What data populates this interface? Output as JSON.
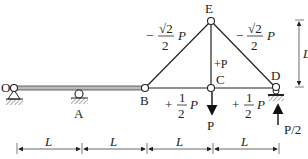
{
  "diagram": {
    "type": "truss-beam",
    "joints": [
      {
        "id": "O",
        "label": "O",
        "x": 14,
        "y": 88
      },
      {
        "id": "A",
        "label": "A",
        "x": 79,
        "y": 88
      },
      {
        "id": "B",
        "label": "B",
        "x": 145,
        "y": 88
      },
      {
        "id": "C",
        "label": "C",
        "x": 211,
        "y": 88
      },
      {
        "id": "D",
        "label": "D",
        "x": 276,
        "y": 88
      },
      {
        "id": "E",
        "label": "E",
        "x": 211,
        "y": 21
      }
    ],
    "members": [
      {
        "from": "O",
        "to": "B",
        "kind": "beam"
      },
      {
        "from": "B",
        "to": "E",
        "kind": "bar",
        "force_sign": "−",
        "force_num": "√2",
        "force_den": "2",
        "force_unit": "P"
      },
      {
        "from": "E",
        "to": "D",
        "kind": "bar",
        "force_sign": "−",
        "force_num": "√2",
        "force_den": "2",
        "force_unit": "P"
      },
      {
        "from": "E",
        "to": "C",
        "kind": "bar",
        "force_text": "+P"
      },
      {
        "from": "B",
        "to": "C",
        "kind": "bar",
        "force_sign": "+",
        "force_num": "1",
        "force_den": "2",
        "force_unit": "P"
      },
      {
        "from": "C",
        "to": "D",
        "kind": "bar",
        "force_sign": "+",
        "force_num": "1",
        "force_den": "2",
        "force_unit": "P"
      }
    ],
    "supports": [
      {
        "at": "O",
        "type": "pin"
      },
      {
        "at": "A",
        "type": "roller"
      },
      {
        "at": "D",
        "type": "roller"
      }
    ],
    "loads": [
      {
        "at": "C",
        "direction": "down",
        "label": "P"
      },
      {
        "at": "D",
        "direction": "up",
        "label": "P/2"
      }
    ],
    "dimensions": {
      "horizontal": [
        "L",
        "L",
        "L",
        "L"
      ],
      "vertical": "L"
    }
  }
}
